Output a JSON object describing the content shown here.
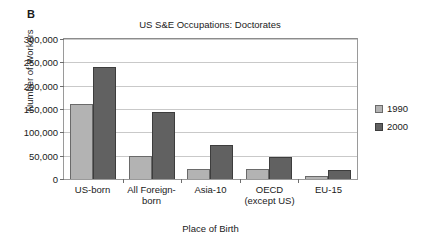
{
  "panel": {
    "label": "B"
  },
  "legend": {
    "position": "right",
    "items": [
      {
        "label": "1990",
        "color": "#b3b3b3",
        "swatch_name": "legend-swatch-1990"
      },
      {
        "label": "2000",
        "color": "#616161",
        "swatch_name": "legend-swatch-2000"
      }
    ]
  },
  "axis": {
    "y_ticks": [
      "0",
      "50,000",
      "100,000",
      "150,000",
      "200,000",
      "250,000",
      "300,000"
    ]
  },
  "chart_data": {
    "type": "bar",
    "title": "US S&E Occupations: Doctorates",
    "xlabel": "Place of Birth",
    "ylabel": "Number of Workers",
    "categories": [
      "US-born",
      "All Foreign-\nborn",
      "Asia-10",
      "OECD\n(except US)",
      "EU-15"
    ],
    "categories_display": [
      [
        "US-born"
      ],
      [
        "All Foreign-",
        "born"
      ],
      [
        "Asia-10"
      ],
      [
        "OECD",
        "(except US)"
      ],
      [
        "EU-15"
      ]
    ],
    "series": [
      {
        "name": "1990",
        "color": "#b3b3b3",
        "values": [
          160000,
          50000,
          22000,
          21000,
          7000
        ]
      },
      {
        "name": "2000",
        "color": "#616161",
        "values": [
          241000,
          143000,
          72000,
          47000,
          19000
        ]
      }
    ],
    "ylim": [
      0,
      300000
    ],
    "ytick_step": 50000,
    "grid": true,
    "legend_position": "right"
  }
}
